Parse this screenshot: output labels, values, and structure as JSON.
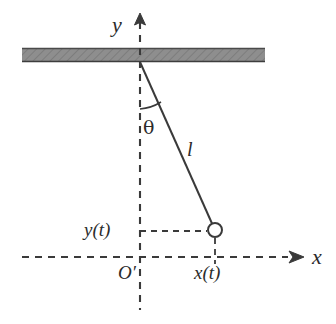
{
  "figure": {
    "type": "physics-diagram",
    "background_color": "#ffffff",
    "stroke_color": "#3a3a3a",
    "ceiling_fill_color": "#8c8c8c",
    "ceiling_edge_color": "#4a4a4a"
  },
  "labels": {
    "y_axis": "y",
    "x_axis": "x",
    "angle": "θ",
    "rod_length": "l",
    "y_coordinate": "y(t)",
    "x_coordinate": "x(t)",
    "origin": "O′"
  },
  "geometry": {
    "ceiling": {
      "x": 22,
      "y": 48,
      "width": 243,
      "height": 14
    },
    "pivot": {
      "x": 140,
      "y": 62
    },
    "bob": {
      "x": 215,
      "y": 230,
      "radius": 7
    },
    "y_axis_line": {
      "x": 140,
      "y_top": 22,
      "y_bottom": 310
    },
    "y_axis_arrow_tip": {
      "x": 140,
      "y": 14
    },
    "x_axis_line": {
      "y": 257,
      "x_left": 22,
      "x_right": 290
    },
    "x_axis_arrow_tip": {
      "x": 303,
      "y": 257
    },
    "angle_arc_radius": 47,
    "guide_line_horizontal": {
      "y": 231,
      "x_from": 140,
      "x_to": 210
    },
    "guide_line_vertical": {
      "x": 215,
      "y_from": 238,
      "y_to": 264
    }
  }
}
